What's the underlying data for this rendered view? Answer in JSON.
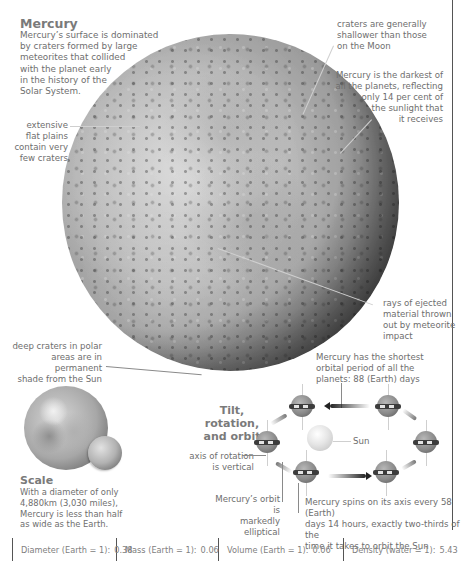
{
  "header": {
    "title": "Mercury",
    "intro": [
      "Mercury’s surface is dominated",
      "by craters formed by large",
      "meteorites that collided",
      "with the planet early",
      "in the history of the",
      "Solar System."
    ]
  },
  "annotations": {
    "shallow_craters": [
      "craters are generally",
      "shallower than those",
      "on the Moon"
    ],
    "darkest": [
      "Mercury is the darkest of",
      "all the planets, reflecting",
      "only 14 per cent of",
      "the sunlight that",
      "it receives"
    ],
    "flat_plains": [
      "extensive",
      "flat plains",
      "contain very",
      "few craters"
    ],
    "rays": [
      "rays of ejected",
      "material thrown",
      "out by meteorite",
      "impact"
    ],
    "polar": [
      "deep craters in polar",
      "areas are in permanent",
      "shade from the Sun"
    ]
  },
  "scale": {
    "title": "Scale",
    "text": [
      "With a diameter of only",
      "4,880km (3,030 miles),",
      "Mercury is less than half",
      "as wide as the Earth."
    ]
  },
  "orbit": {
    "title": [
      "Tilt, rotation,",
      "and orbit"
    ],
    "orbital_period": [
      "Mercury has the shortest",
      "orbital period of all the",
      "planets: 88 (Earth) days"
    ],
    "sun_label": "Sun",
    "axis_label": [
      "axis of rotation",
      "is vertical"
    ],
    "elliptical": [
      "Mercury’s orbit is",
      "markedly elliptical"
    ],
    "spin": [
      "Mercury spins on its axis every 58 (Earth)",
      "days 14 hours, exactly two-thirds of the",
      "time it takes to orbit the Sun"
    ]
  },
  "stats": [
    {
      "label": "Diameter (Earth = 1):",
      "value": "0.38"
    },
    {
      "label": "Mass (Earth = 1):",
      "value": "0.06"
    },
    {
      "label": "Volume (Earth = 1):",
      "value": "0.06"
    },
    {
      "label": "Density (water = 1):",
      "value": "5.43"
    }
  ],
  "colors": {
    "text": "#6e6e6e",
    "title": "#7a7a7a",
    "rule": "#555555",
    "leader": "#cfcfcf"
  }
}
